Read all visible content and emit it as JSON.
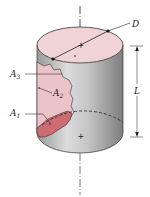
{
  "figure": {
    "type": "cylinder-diagram",
    "labels": {
      "diameter": "D",
      "length": "L",
      "area_3": "A",
      "area_3_sub": "3",
      "area_2": "A",
      "area_2_sub": "2",
      "area_1": "A",
      "area_1_sub": "1"
    },
    "colors": {
      "top_face": "#f0d3d6",
      "body_light": "#d8d8d8",
      "body_dark": "#8e8e8e",
      "region_a2": "#ebc3c8",
      "region_a1": "#cd6b73",
      "line": "#222222"
    }
  }
}
